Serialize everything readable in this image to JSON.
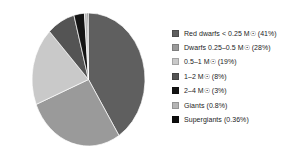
{
  "chart_data": {
    "type": "pie",
    "title": "",
    "subtitle": "",
    "xlabel": "",
    "ylabel": "",
    "grid": false,
    "legend_position": "right",
    "start_angle_deg": 0,
    "direction": "clockwise",
    "categories": [
      "Red dwarfs < 0.25 M☉",
      "Dwarfs 0.25–0.5 M☉",
      "0.5–1 M☉",
      "1–2 M☉",
      "2–4 M☉",
      "Giants",
      "Supergiants"
    ],
    "values": [
      41,
      28,
      19,
      8,
      3,
      0.8,
      0.36
    ],
    "value_unit": "%",
    "colors": [
      "#5f5f5f",
      "#9a9a9a",
      "#c9c9c9",
      "#545454",
      "#141414",
      "#b5b5b5",
      "#0d0d0d"
    ],
    "slices": [
      {
        "label": "Red dwarfs < 0.25 M☉",
        "value": 41,
        "color": "#5f5f5f"
      },
      {
        "label": "Dwarfs 0.25–0.5 M☉",
        "value": 28,
        "color": "#9a9a9a"
      },
      {
        "label": "0.5–1 M☉",
        "value": 19,
        "color": "#c9c9c9"
      },
      {
        "label": "1–2 M☉",
        "value": 8,
        "color": "#545454"
      },
      {
        "label": "2–4 M☉",
        "value": 3,
        "color": "#141414"
      },
      {
        "label": "Giants",
        "value": 0.8,
        "color": "#b5b5b5"
      },
      {
        "label": "Supergiants",
        "value": 0.36,
        "color": "#0d0d0d"
      }
    ]
  },
  "legend": {
    "items": [
      {
        "text": "Red dwarfs < 0.25 M☉ (41%)",
        "color": "#5f5f5f",
        "icon": "legend-swatch-icon"
      },
      {
        "text": "Dwarfs 0.25–0.5 M☉ (28%)",
        "color": "#9a9a9a",
        "icon": "legend-swatch-icon"
      },
      {
        "text": "0.5–1 M☉ (19%)",
        "color": "#c9c9c9",
        "icon": "legend-swatch-icon"
      },
      {
        "text": "1–2 M☉ (8%)",
        "color": "#545454",
        "icon": "legend-swatch-icon"
      },
      {
        "text": "2–4 M☉ (3%)",
        "color": "#141414",
        "icon": "legend-swatch-icon"
      },
      {
        "text": "Giants (0.8%)",
        "color": "#b5b5b5",
        "icon": "legend-swatch-icon"
      },
      {
        "text": "Supergiants (0.36%)",
        "color": "#0d0d0d",
        "icon": "legend-swatch-icon"
      }
    ]
  },
  "colors": {
    "background": "#ffffff",
    "text": "#1d1d1d"
  }
}
